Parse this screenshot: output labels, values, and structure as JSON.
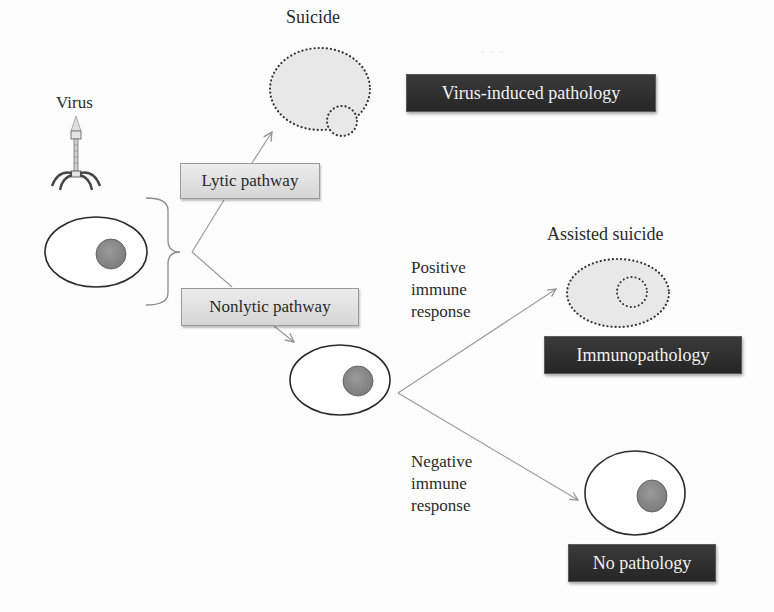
{
  "diagram": {
    "type": "flow",
    "labels": {
      "virus": "Virus",
      "suicide": "Suicide",
      "assisted_suicide": "Assisted suicide",
      "positive_response": [
        "Positive",
        "immune",
        "response"
      ],
      "negative_response": [
        "Negative",
        "immune",
        "response"
      ]
    },
    "pathways": {
      "lytic": "Lytic pathway",
      "nonlytic": "Nonlytic pathway"
    },
    "outcomes": {
      "virus_induced": "Virus-induced pathology",
      "immunopathology": "Immunopathology",
      "none": "No pathology"
    },
    "nodes": [
      {
        "id": "virus",
        "label": "Virus",
        "shape": "bacteriophage-icon"
      },
      {
        "id": "infected-cell",
        "shape": "cell-with-nucleus"
      },
      {
        "id": "lytic",
        "label": "Lytic pathway",
        "shape": "gray-box"
      },
      {
        "id": "nonlytic",
        "label": "Nonlytic pathway",
        "shape": "gray-box"
      },
      {
        "id": "suicide-cell",
        "label": "Suicide",
        "shape": "dotted-lysed-cell"
      },
      {
        "id": "persistent-cell",
        "shape": "cell-with-nucleus"
      },
      {
        "id": "assisted-cell",
        "label": "Assisted suicide",
        "shape": "dotted-lysed-cell"
      },
      {
        "id": "healthy-cell",
        "shape": "cell-with-nucleus"
      },
      {
        "id": "out1",
        "label": "Virus-induced pathology",
        "shape": "dark-box"
      },
      {
        "id": "out2",
        "label": "Immunopathology",
        "shape": "dark-box"
      },
      {
        "id": "out3",
        "label": "No pathology",
        "shape": "dark-box"
      }
    ],
    "edges": [
      {
        "from": "infected-cell",
        "to": "lytic"
      },
      {
        "from": "infected-cell",
        "to": "nonlytic"
      },
      {
        "from": "lytic",
        "to": "suicide-cell"
      },
      {
        "from": "nonlytic",
        "to": "persistent-cell"
      },
      {
        "from": "persistent-cell",
        "to": "assisted-cell",
        "label": "Positive immune response"
      },
      {
        "from": "persistent-cell",
        "to": "healthy-cell",
        "label": "Negative immune response"
      }
    ],
    "colors": {
      "cell_outline": "#2b2b2b",
      "nucleus": "#8a8a8a",
      "dotted_fill": "#e8e8e8",
      "arrow": "#9a9a9a",
      "pathway_box": "#dcdcdc",
      "outcome_box": "#2e2e2e",
      "outcome_text": "#f2f2f2"
    }
  }
}
